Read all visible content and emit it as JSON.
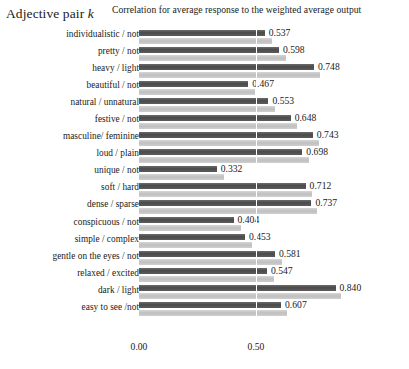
{
  "header": {
    "y_axis_title_text": "Adjective pair ",
    "y_axis_title_italic": "k",
    "chart_title": "Correlation for average response to the weighted average output"
  },
  "chart_data": {
    "type": "bar",
    "orientation": "horizontal",
    "title": "Correlation for average response to the weighted average output",
    "xlabel": "",
    "ylabel": "Adjective pair k",
    "xlim": [
      0.0,
      1.0
    ],
    "xticks": [
      0.0,
      0.5
    ],
    "xticklabels": [
      "0.00",
      "0.50"
    ],
    "grid": true,
    "legend": "none",
    "categories": [
      "individualistic / not",
      "pretty / not",
      "heavy / light",
      "beautiful / not",
      "natural / unnatural",
      "festive / not",
      "masculine/ feminine",
      "loud / plain",
      "unique / not",
      "soft / hard",
      "dense / sparse",
      "conspicuous / not",
      "simple / complex",
      "gentle on the eyes / not",
      "relaxed / excited",
      "dark / light",
      "easy to see /not"
    ],
    "series": [
      {
        "name": "dark-bar",
        "color": "#555555",
        "values": [
          0.537,
          0.598,
          0.748,
          0.467,
          0.553,
          0.648,
          0.743,
          0.698,
          0.332,
          0.712,
          0.737,
          0.404,
          0.453,
          0.581,
          0.547,
          0.84,
          0.607
        ]
      },
      {
        "name": "light-bar",
        "color": "#c9c9c9",
        "values": [
          0.57,
          0.628,
          0.775,
          0.497,
          0.581,
          0.676,
          0.77,
          0.726,
          0.362,
          0.74,
          0.762,
          0.434,
          0.481,
          0.61,
          0.576,
          0.862,
          0.634
        ]
      }
    ],
    "data_labels": [
      "0.537",
      "0.598",
      "0.748",
      "0.467",
      "0.553",
      "0.648",
      "0.743",
      "0.698",
      "0.332",
      "0.712",
      "0.737",
      "0.404",
      "0.453",
      "0.581",
      "0.547",
      "0.840",
      "0.607"
    ]
  },
  "scale": {
    "x_origin_px": 139,
    "px_per_unit": 234
  }
}
